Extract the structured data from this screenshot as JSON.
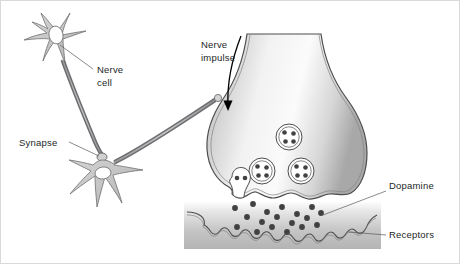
{
  "figure": {
    "background_color": "#ffffff",
    "border_color": "#d9d9d9",
    "width": 460,
    "height": 264
  },
  "labels": {
    "nerve_cell_line1": "Nerve",
    "nerve_cell_line2": "cell",
    "synapse": "Synapse",
    "nerve_impulse_line1": "Nerve",
    "nerve_impulse_line2": "impulse",
    "dopamine": "Dopamine",
    "receptors": "Receptors"
  },
  "colors": {
    "text": "#221f1f",
    "outline": "#4d4d4f",
    "cell_fill": "#c9c9c9",
    "leader_line": "#58595b",
    "granule": "#414042",
    "panel_shade": "#b3b3b3"
  },
  "overview_panel": {
    "neurons": [
      {
        "name": "presynaptic-neuron",
        "soma_center": [
          56,
          36
        ],
        "nucleus_center": [
          57,
          34
        ],
        "dendrite_count": 5
      },
      {
        "name": "postsynaptic-neuron",
        "soma_center": [
          103,
          175
        ],
        "nucleus_center": [
          103,
          172
        ],
        "dendrite_count": 5
      }
    ],
    "synapse_bouton": [
      101,
      155
    ],
    "axon_description": "Long curved axon from upper neuron descending to synapse on lower neuron"
  },
  "detail_panel": {
    "axon_terminal": {
      "name": "presynaptic-terminal",
      "neck_top_y": 33,
      "bulb_bottom_y": 200
    },
    "vesicles": [
      {
        "name": "vesicle-top",
        "cx": 288,
        "cy": 136,
        "r": 13,
        "granules": 4
      },
      {
        "name": "vesicle-left",
        "cx": 261,
        "cy": 170,
        "r": 13,
        "granules": 4
      },
      {
        "name": "vesicle-right",
        "cx": 300,
        "cy": 170,
        "r": 13,
        "granules": 4
      },
      {
        "name": "vesicle-fusing",
        "cx": 236,
        "cy": 186,
        "r": 10,
        "granules": 2
      }
    ],
    "transmitter_dots": [
      [
        234,
        207
      ],
      [
        252,
        203
      ],
      [
        266,
        211
      ],
      [
        281,
        206
      ],
      [
        296,
        213
      ],
      [
        311,
        206
      ],
      [
        246,
        216
      ],
      [
        261,
        221
      ],
      [
        276,
        216
      ],
      [
        291,
        222
      ],
      [
        306,
        217
      ],
      [
        320,
        212
      ],
      [
        236,
        226
      ],
      [
        256,
        231
      ],
      [
        271,
        226
      ],
      [
        286,
        231
      ],
      [
        301,
        226
      ],
      [
        316,
        224
      ]
    ],
    "shade_panel": {
      "x": 183,
      "y": 200,
      "width": 197,
      "height": 48
    }
  }
}
